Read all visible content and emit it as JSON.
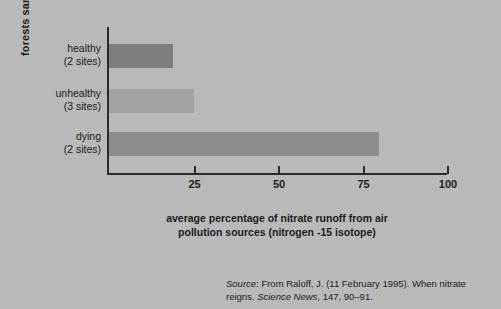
{
  "chart_data": {
    "type": "bar",
    "orientation": "horizontal",
    "title": "",
    "categories": [
      "healthy\n(2 sites)",
      "unhealthy\n(3 sites)",
      "dying\n(2 sites)"
    ],
    "category_lines": [
      [
        "healthy",
        "(2 sites)"
      ],
      [
        "unhealthy",
        "(3 sites)"
      ],
      [
        "dying",
        "(2 sites)"
      ]
    ],
    "values": [
      19,
      25,
      80
    ],
    "xlabel": "average percentage of nitrate runoff from air pollution sources (nitrogen -15 isotope)",
    "xlabel_lines": [
      "average percentage of nitrate runoff from air",
      "pollution sources (nitrogen -15 isotope)"
    ],
    "ylabel": "forests sampled",
    "xlim": [
      0,
      100
    ],
    "ticks": [
      25,
      50,
      75,
      100
    ],
    "tick_labels": [
      "25",
      "50",
      "75",
      "100"
    ],
    "grid": false,
    "legend": false,
    "bar_colors": [
      "#7e7e7e",
      "#a3a3a3",
      "#8d8d8d"
    ],
    "background_color": "#b9b9b9",
    "axis_color": "#2b2b2b"
  },
  "source": {
    "label": "Source",
    "colon": ":",
    "text_1": " From Raloff, J. (11 February 1995). When nitrate reigns. ",
    "journal": "Science News",
    "text_2": ", 147, 90–91."
  }
}
